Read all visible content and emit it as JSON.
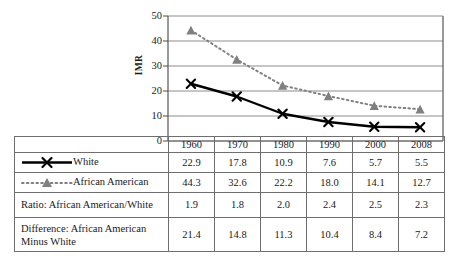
{
  "chart_data": {
    "type": "line",
    "title": "",
    "xlabel": "",
    "ylabel": "IMR",
    "ylim": [
      0,
      50
    ],
    "yticks": [
      0,
      10,
      20,
      30,
      40,
      50
    ],
    "ytick_labels": [
      "0",
      "10",
      "20",
      "30",
      "40",
      "50"
    ],
    "grid": true,
    "legend_position": "table-row-labels",
    "categories": [
      "1960",
      "1970",
      "1980",
      "1990",
      "2000",
      "2008"
    ],
    "series": [
      {
        "name": "White",
        "values": [
          22.9,
          17.8,
          10.9,
          7.6,
          5.7,
          5.5
        ],
        "color": "#000000",
        "marker": "x",
        "line_style": "solid"
      },
      {
        "name": "African American",
        "values": [
          44.3,
          32.6,
          22.2,
          18.0,
          14.1,
          12.7
        ],
        "color": "#808080",
        "marker": "triangle",
        "line_style": "dotted"
      }
    ],
    "derived_rows": [
      {
        "name": "Ratio: African American/White",
        "values": [
          "1.9",
          "1.8",
          "2.0",
          "2.4",
          "2.5",
          "2.3"
        ]
      },
      {
        "name": "Difference: African American Minus White",
        "values": [
          "21.4",
          "14.8",
          "11.3",
          "10.4",
          "8.4",
          "7.2"
        ]
      }
    ]
  },
  "table": {
    "columns": [
      "1960",
      "1970",
      "1980",
      "1990",
      "2000",
      "2008"
    ],
    "rows": [
      {
        "label": "White",
        "values": [
          "22.9",
          "17.8",
          "10.9",
          "7.6",
          "5.7",
          "5.5"
        ]
      },
      {
        "label": "African American",
        "values": [
          "44.3",
          "32.6",
          "22.2",
          "18.0",
          "14.1",
          "12.7"
        ]
      },
      {
        "label": "Ratio: African American/White",
        "values": [
          "1.9",
          "1.8",
          "2.0",
          "2.4",
          "2.5",
          "2.3"
        ]
      },
      {
        "label": "Difference: African American Minus White",
        "label_line1": "Difference: African American",
        "label_line2": "Minus White",
        "values": [
          "21.4",
          "14.8",
          "11.3",
          "10.4",
          "8.4",
          "7.2"
        ]
      }
    ]
  },
  "axis": {
    "y_title": "IMR",
    "y_labels": [
      "50",
      "40",
      "30",
      "20",
      "10",
      "0"
    ]
  },
  "colors": {
    "white_series": "#000000",
    "african_american_series": "#808080",
    "grid": "#8c8c8c",
    "axis": "#6e6e6e",
    "table_border": "#6e6e6e",
    "text": "#1a1a1a"
  }
}
